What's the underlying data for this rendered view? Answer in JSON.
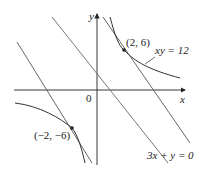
{
  "diagram": {
    "axes": {
      "x_label": "x",
      "y_label": "y",
      "origin_label": "0"
    },
    "curve": {
      "equation": "xy = 12"
    },
    "line_through_origin": {
      "equation": "3x + y = 0"
    },
    "points": [
      {
        "label": "(2, 6)"
      },
      {
        "label": "(−2, −6)"
      }
    ],
    "colors": {
      "axis": "#222222",
      "curve": "#333333",
      "lines": "#555555"
    }
  }
}
